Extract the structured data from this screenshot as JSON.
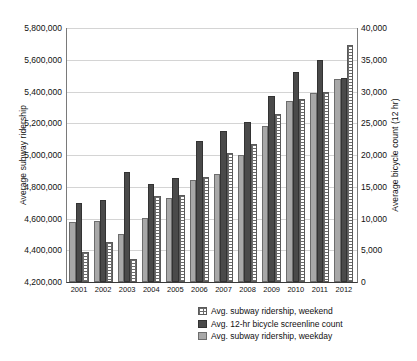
{
  "chart_data": {
    "type": "bar",
    "title": "",
    "xlabel": "",
    "ylabel": "Average subway ridership",
    "y2label": "Average bicycle count (12 hr)",
    "grid": true,
    "legend_position": "bottom-right",
    "categories": [
      "2001",
      "2002",
      "2003",
      "2004",
      "2005",
      "2006",
      "2007",
      "2008",
      "2009",
      "2010",
      "2011",
      "2012"
    ],
    "ylim": [
      4200000,
      5800000
    ],
    "y2lim": [
      0,
      40000
    ],
    "yticks": [
      "4,200,000",
      "4,400,000",
      "4,600,000",
      "4,800,000",
      "5,000,000",
      "5,200,000",
      "5,400,000",
      "5,600,000",
      "5,800,000"
    ],
    "y2ticks": [
      "0",
      "5,000",
      "10,000",
      "15,000",
      "20,000",
      "25,000",
      "30,000",
      "35,000",
      "40,000"
    ],
    "series": [
      {
        "name": "Avg. subway ridership, weekday",
        "axis": "left",
        "style": "light-gray-fill",
        "values": [
          4580000,
          4585000,
          4505000,
          4605000,
          4730000,
          4840000,
          4880000,
          5000000,
          5180000,
          5340000,
          5390000,
          5480000
        ]
      },
      {
        "name": "Avg. 12-hr bicycle screenline count",
        "axis": "right",
        "style": "dark-gray-fill",
        "values": [
          12500,
          12900,
          17200,
          15500,
          16400,
          22300,
          23800,
          25300,
          29200,
          33100,
          35000,
          32100
        ],
        "values_plotted_on_left_scale": [
          4700000,
          4715000,
          4890000,
          4820000,
          4855000,
          5090000,
          5150000,
          5210000,
          5370000,
          5525000,
          5600000,
          5485000
        ]
      },
      {
        "name": "Avg. subway ridership, weekend",
        "axis": "left",
        "style": "white-dotted-fill",
        "values": [
          4390000,
          4455000,
          4345000,
          4740000,
          4745000,
          4860000,
          5010000,
          5070000,
          5260000,
          5355000,
          5400000,
          5690000
        ]
      }
    ]
  },
  "legend": {
    "items": [
      {
        "label": "Avg. subway ridership, weekend",
        "swatch": "weekend"
      },
      {
        "label": "Avg. 12-hr bicycle screenline count",
        "swatch": "bicycle"
      },
      {
        "label": "Avg. subway ridership, weekday",
        "swatch": "weekday"
      }
    ]
  }
}
